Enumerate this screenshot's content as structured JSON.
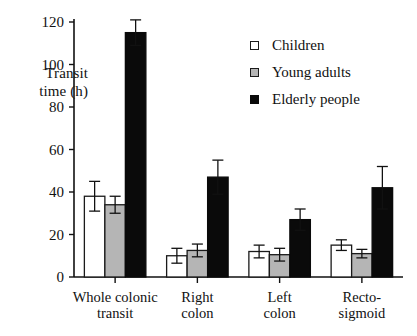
{
  "chart_data": {
    "type": "bar",
    "title": "",
    "subtitle": "",
    "xlabel": "",
    "ylabel": "Transit\ntime (h)",
    "ylim": [
      0,
      120
    ],
    "yticks": [
      0,
      20,
      40,
      60,
      80,
      100,
      120
    ],
    "ytick_labels": [
      "0",
      "20",
      "40",
      "60",
      "80",
      "100",
      "120"
    ],
    "grid": false,
    "legend_position": "upper-right-inside",
    "error_bars": "standard error",
    "categories": [
      "Whole colonic\ntransit",
      "Right\ncolon",
      "Left\ncolon",
      "Recto-\nsigmoid"
    ],
    "series": [
      {
        "name": "Children",
        "color": "#ffffff",
        "edge_color": "#1a1a1a",
        "values": [
          38,
          10,
          12,
          15
        ],
        "errors": [
          7,
          3.5,
          3,
          2.5
        ]
      },
      {
        "name": "Young adults",
        "color": "#b5b5b5",
        "edge_color": "#1a1a1a",
        "values": [
          34,
          12.5,
          10.5,
          11
        ],
        "errors": [
          4,
          3,
          3,
          2
        ]
      },
      {
        "name": "Elderly people",
        "color": "#0a0a0a",
        "edge_color": "#0a0a0a",
        "values": [
          115,
          47,
          27,
          42
        ],
        "errors": [
          6,
          8,
          5,
          10
        ]
      }
    ]
  },
  "legend": {
    "items": [
      {
        "label": "Children",
        "swatch": "white-square-icon"
      },
      {
        "label": "Young adults",
        "swatch": "gray-square-icon"
      },
      {
        "label": "Elderly people",
        "swatch": "black-square-icon"
      }
    ]
  },
  "axes": {
    "y_title": "Transit\ntime (h)",
    "y_tick_labels": [
      "120",
      "100",
      "80",
      "60",
      "40",
      "20",
      "0"
    ],
    "x_tick_labels": [
      "Whole colonic\ntransit",
      "Right\ncolon",
      "Left\ncolon",
      "Recto-\nsigmoid"
    ]
  }
}
